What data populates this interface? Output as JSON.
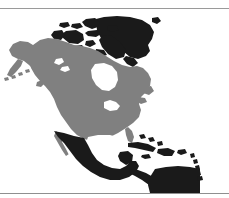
{
  "figure": {
    "kind": "world-region-map",
    "projection_label": "",
    "background_color": "#ffffff",
    "frame": {
      "top_rule_color": "#9a9a9a",
      "bottom_rule_color": "#8f8f8f",
      "side_edge_color": "#e6e6e6",
      "top_rule_y": 8,
      "bottom_rule_y": 193
    }
  },
  "map": {
    "ocean_color": "#ffffff",
    "land_primary_color": "#808080",
    "land_secondary_color": "#1a1a1a",
    "inland_water_color": "#ffffff",
    "viewbox": "0 0 229 184",
    "regions": [
      {
        "name": "greenland",
        "label": "Greenland",
        "fill_key": "land_secondary_color"
      },
      {
        "name": "canadian-arctic-archipelago",
        "label": "Canadian Arctic Archipelago",
        "fill_key": "land_secondary_color"
      },
      {
        "name": "canada-mainland",
        "label": "Canada",
        "fill_key": "land_primary_color"
      },
      {
        "name": "alaska",
        "label": "Alaska",
        "fill_key": "land_primary_color"
      },
      {
        "name": "aleutian-islands",
        "label": "Aleutian Islands",
        "fill_key": "land_primary_color"
      },
      {
        "name": "united-states",
        "label": "United States",
        "fill_key": "land_primary_color"
      },
      {
        "name": "mexico",
        "label": "Mexico",
        "fill_key": "land_secondary_color"
      },
      {
        "name": "central-america",
        "label": "Central America",
        "fill_key": "land_secondary_color"
      },
      {
        "name": "cuba",
        "label": "Cuba",
        "fill_key": "land_secondary_color"
      },
      {
        "name": "hispaniola",
        "label": "Hispaniola",
        "fill_key": "land_secondary_color"
      },
      {
        "name": "lesser-antilles",
        "label": "Lesser Antilles",
        "fill_key": "land_secondary_color"
      },
      {
        "name": "northern-south-america",
        "label": "Northern South America",
        "fill_key": "land_secondary_color"
      },
      {
        "name": "hudson-bay",
        "label": "Hudson Bay",
        "fill_key": "inland_water_color"
      },
      {
        "name": "great-lakes",
        "label": "Great Lakes",
        "fill_key": "inland_water_color"
      },
      {
        "name": "gulf-of-mexico",
        "label": "Gulf of Mexico",
        "fill_key": "inland_water_color"
      },
      {
        "name": "great-bear-lake",
        "label": "Great Bear Lake",
        "fill_key": "inland_water_color"
      },
      {
        "name": "great-slave-lake",
        "label": "Great Slave Lake",
        "fill_key": "inland_water_color"
      }
    ]
  }
}
